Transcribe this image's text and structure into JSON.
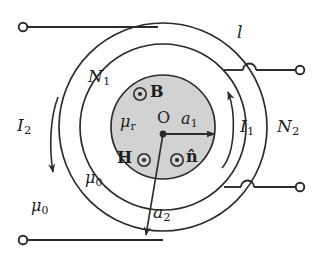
{
  "figure": {
    "background_color": "#ffffff",
    "line_color": "#2b2b2b",
    "core_fill_color": "#d2d2d2"
  },
  "labels": {
    "length_l": "l",
    "turns_inner": "N",
    "turns_inner_sub": "1",
    "turns_outer": "N",
    "turns_outer_sub": "2",
    "current_inner": "I",
    "current_inner_sub": "1",
    "current_outer": "I",
    "current_outer_sub": "2",
    "mu_relative": "μ",
    "mu_relative_sub": "r",
    "mu_zero_annulus": "μ",
    "mu_zero_annulus_sub": "0",
    "mu_zero_outside": "μ",
    "mu_zero_outside_sub": "0",
    "radius_inner": "a",
    "radius_inner_sub": "1",
    "radius_outer": "a",
    "radius_outer_sub": "2",
    "center_point": "O",
    "flux_density": "B",
    "field_intensity": "H",
    "unit_normal": "n̂"
  },
  "geometry": {
    "center_x": 163,
    "center_y": 127,
    "core_radius": 52,
    "middle_radius": 83,
    "outer_radius": 104,
    "terminal_radius": 4
  },
  "icons": {
    "dot_out_of_page": "out-of-page-dot",
    "terminal": "open-terminal-circle",
    "wire_hop": "wire-crossover-hop",
    "arrow_current_inner": "ccw-current-arrow",
    "arrow_current_outer": "cw-current-arrow"
  }
}
